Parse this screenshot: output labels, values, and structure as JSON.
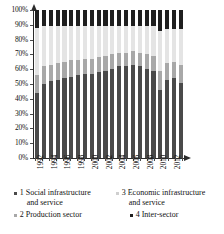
{
  "chart_data": {
    "type": "bar",
    "stacked": true,
    "normalized_percent": true,
    "title": "",
    "xlabel": "",
    "ylabel": "",
    "ylim": [
      0,
      100
    ],
    "grid": false,
    "legend_position": "bottom",
    "y_ticks": [
      "0%",
      "10%",
      "20%",
      "30%",
      "40%",
      "50%",
      "60%",
      "70%",
      "80%",
      "90%",
      "100%"
    ],
    "categories": [
      "1992",
      "1993",
      "1994",
      "1995",
      "1996",
      "1997",
      "1998",
      "1999",
      "2000",
      "2001",
      "2002",
      "2003",
      "2004",
      "2005",
      "2006",
      "2007",
      "2008",
      "2009",
      "2010",
      "2011",
      "2012",
      "2013"
    ],
    "x_tick_labels_shown": [
      "1992",
      "",
      "1994",
      "",
      "1996",
      "",
      "1998",
      "",
      "2000",
      "",
      "2002",
      "",
      "2004",
      "",
      "2006",
      "",
      "2008",
      "",
      "2010",
      "",
      "2012",
      ""
    ],
    "series": [
      {
        "name": "1 Social infrastructure and service",
        "color": "#4a4a4a",
        "values": [
          44,
          50,
          52,
          53,
          54,
          55,
          56,
          57,
          57,
          58,
          59,
          60,
          62,
          62,
          63,
          62,
          60,
          59,
          46,
          53,
          54,
          51
        ]
      },
      {
        "name": "2 Production sector",
        "color": "#a8a8a8",
        "values": [
          12,
          12,
          11,
          11,
          11,
          11,
          10,
          10,
          10,
          10,
          10,
          10,
          9,
          9,
          9,
          9,
          10,
          10,
          13,
          11,
          11,
          12
        ]
      },
      {
        "name": "3 Economic infrastructure and service",
        "color": "#e4e4e4",
        "values": [
          32,
          27,
          26,
          25,
          24,
          23,
          23,
          22,
          22,
          21,
          20,
          19,
          18,
          18,
          17,
          18,
          19,
          20,
          27,
          23,
          22,
          24
        ]
      },
      {
        "name": "4 Inter-sector",
        "color": "#1f1f1f",
        "values": [
          12,
          11,
          11,
          11,
          11,
          11,
          11,
          11,
          11,
          11,
          11,
          11,
          11,
          11,
          11,
          11,
          11,
          11,
          14,
          13,
          13,
          13
        ]
      }
    ]
  },
  "legend": {
    "items": [
      {
        "id": "1",
        "line1": "1 Social infrastructure",
        "line2": "and service",
        "color": "#4a4a4a"
      },
      {
        "id": "3",
        "line1": "3 Economic infrastructure",
        "line2": "and service",
        "color": "#cfcfcf"
      },
      {
        "id": "2",
        "line1": "2 Production sector",
        "line2": "",
        "color": "#a8a8a8"
      },
      {
        "id": "4",
        "line1": "4 Inter-sector",
        "line2": "",
        "color": "#1f1f1f"
      }
    ]
  }
}
